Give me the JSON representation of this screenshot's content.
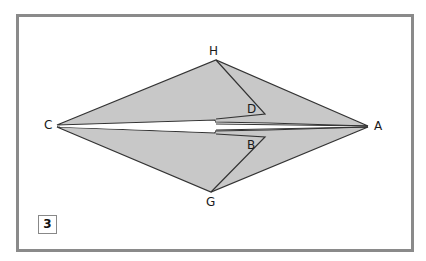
{
  "diagram": {
    "step_number": "3",
    "points": {
      "H": "H",
      "C": "C",
      "A": "A",
      "G": "G",
      "D": "D",
      "B": "B"
    },
    "colors": {
      "fill": "#c8c8c8",
      "stroke": "#333333",
      "frame": "#8a8a8a"
    }
  }
}
